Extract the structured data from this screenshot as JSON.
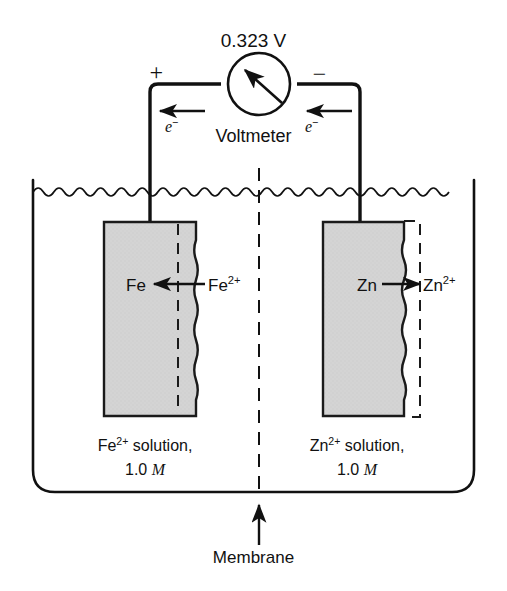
{
  "figure": {
    "voltage_reading": "0.323 V",
    "voltmeter_label": "Voltmeter",
    "voltmeter_symbol": "V",
    "terminals": {
      "left_sign": "+",
      "right_sign": "−"
    },
    "electron_flow": {
      "left_label": "e",
      "left_charge": "−",
      "right_label": "e",
      "right_charge": "−",
      "direction": "leftward"
    },
    "left_cell": {
      "electrode_label": "Fe",
      "ion_label": "Fe",
      "ion_charge": "2+",
      "reaction_direction": "left",
      "solution_line1_species": "Fe",
      "solution_line1_charge": "2+",
      "solution_line1_text": " solution,",
      "solution_line2_value": "1.0",
      "solution_line2_unit": "M"
    },
    "right_cell": {
      "electrode_label": "Zn",
      "ion_label": "Zn",
      "ion_charge": "2+",
      "reaction_direction": "right",
      "solution_line1_species": "Zn",
      "solution_line1_charge": "2+",
      "solution_line1_text": " solution,",
      "solution_line2_value": "1.0",
      "solution_line2_unit": "M"
    },
    "membrane_label": "Membrane",
    "icons": {
      "water_surface": "wavy-line-icon",
      "meter": "voltmeter-circle-icon",
      "needle": "meter-needle-icon",
      "membrane": "dashed-vertical-line-icon",
      "pointer": "up-arrow-icon"
    },
    "colors": {
      "ink": "#111111",
      "electrode_fill": "#d4d4d4",
      "electrode_stroke": "#1a1a1a",
      "background": "#ffffff"
    }
  }
}
